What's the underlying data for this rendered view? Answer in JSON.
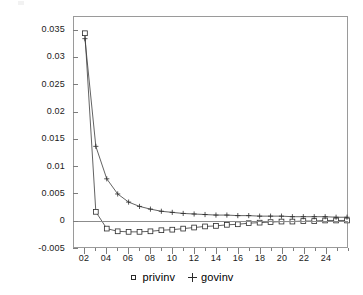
{
  "chart_data": {
    "type": "line",
    "title": "",
    "subtitle": "",
    "xlabel": "",
    "ylabel": "",
    "xlim": [
      1,
      26
    ],
    "ylim": [
      -0.005,
      0.0375
    ],
    "grid": false,
    "zero_line": true,
    "legend_position": "bottom-center",
    "y_ticks": [
      0.035,
      0.03,
      0.025,
      0.02,
      0.015,
      0.01,
      0.005,
      0,
      -0.005
    ],
    "y_tick_labels": [
      "0.035",
      "0.03",
      "0.025",
      "0.02",
      "0.015",
      "0.01",
      "0.005",
      "0",
      "-0.005"
    ],
    "x_ticks": [
      2,
      4,
      6,
      8,
      10,
      12,
      14,
      16,
      18,
      20,
      22,
      24
    ],
    "x_tick_labels": [
      "02",
      "04",
      "06",
      "08",
      "10",
      "12",
      "14",
      "16",
      "18",
      "20",
      "22",
      "24"
    ],
    "x_minor_ticks": [
      3,
      5,
      7,
      9,
      11,
      13,
      15,
      17,
      19,
      21,
      23,
      25,
      26
    ],
    "x": [
      2,
      3,
      4,
      5,
      6,
      7,
      8,
      9,
      10,
      11,
      12,
      13,
      14,
      15,
      16,
      17,
      18,
      19,
      20,
      21,
      22,
      23,
      24,
      25,
      26
    ],
    "series": [
      {
        "name": "privinv",
        "marker": "square",
        "values": [
          0.0345,
          0.0015,
          -0.0016,
          -0.0021,
          -0.0022,
          -0.0022,
          -0.0021,
          -0.0019,
          -0.0018,
          -0.0016,
          -0.0014,
          -0.0012,
          -0.0011,
          -0.0009,
          -0.0008,
          -0.0006,
          -0.0005,
          -0.0004,
          -0.0003,
          -0.0003,
          -0.0002,
          -0.0002,
          -0.0001,
          -0.0001,
          -0.0001
        ]
      },
      {
        "name": "govinv",
        "marker": "plus",
        "values": [
          0.0335,
          0.0136,
          0.0076,
          0.0048,
          0.0033,
          0.0025,
          0.002,
          0.0016,
          0.0014,
          0.0012,
          0.0011,
          0.001,
          0.0009,
          0.0009,
          0.0008,
          0.0008,
          0.0007,
          0.0007,
          0.0007,
          0.0006,
          0.0006,
          0.0006,
          0.0006,
          0.0005,
          0.0005
        ]
      }
    ]
  },
  "legend": {
    "entries": [
      {
        "symbol": "square-marker",
        "label": "privinv"
      },
      {
        "symbol": "plus-marker",
        "label": "govinv"
      }
    ]
  }
}
